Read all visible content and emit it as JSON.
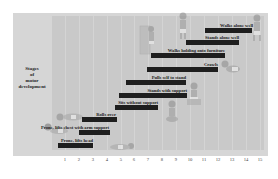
{
  "chart_data": {
    "type": "bar",
    "orientation": "horizontal-range",
    "title": "",
    "ylabel": "Stages of motor development",
    "xlabel": "",
    "xlim": [
      0,
      15.5
    ],
    "x_ticks": [
      1,
      2,
      3,
      4,
      5,
      6,
      7,
      8,
      9,
      10,
      11,
      12,
      13,
      14,
      15
    ],
    "grid": true,
    "legend": null,
    "categories": [
      "Prone, lifts head",
      "Prone, lifts chest with arm support",
      "Rolls over",
      "Sits without support",
      "Stands with support",
      "Pulls self to stand",
      "Crawls",
      "Walks holding onto furniture",
      "Stands alone well",
      "Walks alone well"
    ],
    "series": [
      {
        "name": "Age range (months)",
        "ranges": [
          [
            0.5,
            3.0
          ],
          [
            2.0,
            4.2
          ],
          [
            2.2,
            4.7
          ],
          [
            4.6,
            7.7
          ],
          [
            4.9,
            9.8
          ],
          [
            5.4,
            9.7
          ],
          [
            6.9,
            12.0
          ],
          [
            7.2,
            12.5
          ],
          [
            9.7,
            13.5
          ],
          [
            11.1,
            14.5
          ]
        ]
      }
    ],
    "colors": {
      "bar": "#1e1e1e",
      "plot_bg": "#c9c9c9",
      "frame_bg": "#d6d6d6"
    }
  },
  "chart": {
    "stage_label": "Stages of motor development",
    "stage_label_lines": [
      "Stages",
      "of",
      "motor",
      "development"
    ],
    "bars": [
      {
        "label": "Prone, lifts head"
      },
      {
        "label": "Prone, lifts chest with arm support"
      },
      {
        "label": "Rolls over"
      },
      {
        "label": "Sits without support"
      },
      {
        "label": "Stands with support"
      },
      {
        "label": "Pulls self to stand"
      },
      {
        "label": "Crawls"
      },
      {
        "label": "Walks holding onto furniture"
      },
      {
        "label": "Stands alone well"
      },
      {
        "label": "Walks alone well"
      }
    ],
    "ticks": [
      "1",
      "2",
      "3",
      "4",
      "5",
      "6",
      "7",
      "8",
      "9",
      "10",
      "11",
      "12",
      "13",
      "14",
      "15"
    ]
  }
}
